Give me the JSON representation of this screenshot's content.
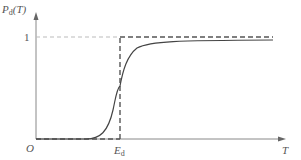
{
  "diagram": {
    "y_axis_label": {
      "main": "P",
      "sub": "d",
      "arg": "(T)"
    },
    "x_axis_label": "T",
    "origin_label": "O",
    "y_tick_label": "1",
    "x_tick_label": {
      "main": "E",
      "sub": "d"
    },
    "curves": [
      {
        "name": "ideal-step",
        "style": "dashed",
        "description": "0 for T<Ed, 1 for T>=Ed"
      },
      {
        "name": "sigmoid-probability",
        "style": "solid",
        "description": "smooth S-curve crossing Ed at ~0.5, approaching 1"
      }
    ],
    "colors": {
      "axis": "#777777",
      "curve": "#444444",
      "dash": "#555555",
      "guide": "#aaaaaa"
    }
  }
}
